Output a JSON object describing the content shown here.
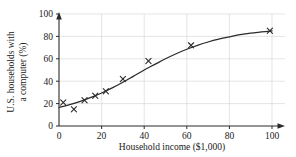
{
  "chart_data": {
    "type": "scatter",
    "title": "",
    "xlabel": "Household income ($1,000)",
    "ylabel": "U.S. households with a computer (%)",
    "ylabel_line1": "U.S. households with",
    "ylabel_line2": "a computer (%)",
    "xlim": [
      0,
      100
    ],
    "ylim": [
      0,
      100
    ],
    "xticks": [
      0,
      20,
      40,
      60,
      80,
      100
    ],
    "yticks": [
      0,
      20,
      40,
      60,
      80,
      100
    ],
    "xtick_labels": [
      "0",
      "20",
      "40",
      "60",
      "80",
      "100"
    ],
    "ytick_labels": [
      "0",
      "20",
      "40",
      "60",
      "80",
      "100"
    ],
    "grid": true,
    "grid_color": "#d8d8d8",
    "legend": "none",
    "marker": "x",
    "marker_color": "#2b2b2b",
    "curve_color": "#2b2b2b",
    "axis_color": "#2b2b2b",
    "points": [
      {
        "x": 2,
        "y": 21
      },
      {
        "x": 7,
        "y": 15
      },
      {
        "x": 12,
        "y": 23
      },
      {
        "x": 17,
        "y": 27
      },
      {
        "x": 22,
        "y": 31
      },
      {
        "x": 30,
        "y": 42
      },
      {
        "x": 42,
        "y": 58
      },
      {
        "x": 62,
        "y": 72
      },
      {
        "x": 99,
        "y": 85
      }
    ],
    "fit_curve": [
      {
        "x": 0,
        "y": 16.5
      },
      {
        "x": 5,
        "y": 19.0
      },
      {
        "x": 10,
        "y": 22.0
      },
      {
        "x": 15,
        "y": 25.5
      },
      {
        "x": 20,
        "y": 29.5
      },
      {
        "x": 25,
        "y": 34.0
      },
      {
        "x": 30,
        "y": 39.0
      },
      {
        "x": 35,
        "y": 44.5
      },
      {
        "x": 40,
        "y": 50.0
      },
      {
        "x": 45,
        "y": 55.0
      },
      {
        "x": 50,
        "y": 60.0
      },
      {
        "x": 55,
        "y": 64.5
      },
      {
        "x": 60,
        "y": 68.5
      },
      {
        "x": 65,
        "y": 72.0
      },
      {
        "x": 70,
        "y": 75.0
      },
      {
        "x": 75,
        "y": 77.5
      },
      {
        "x": 80,
        "y": 79.5
      },
      {
        "x": 85,
        "y": 81.5
      },
      {
        "x": 90,
        "y": 83.0
      },
      {
        "x": 95,
        "y": 84.0
      },
      {
        "x": 100,
        "y": 85.0
      }
    ]
  }
}
